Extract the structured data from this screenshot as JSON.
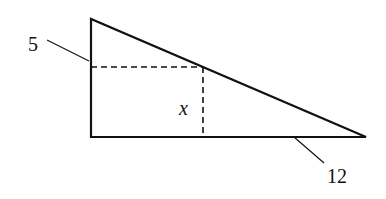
{
  "diagram": {
    "type": "geometry-right-triangle-inscribed-rectangle",
    "labels": {
      "left_side": "5",
      "bottom_side": "12",
      "rectangle_height": "x"
    },
    "colors": {
      "stroke": "#111111",
      "background": "#ffffff"
    }
  }
}
